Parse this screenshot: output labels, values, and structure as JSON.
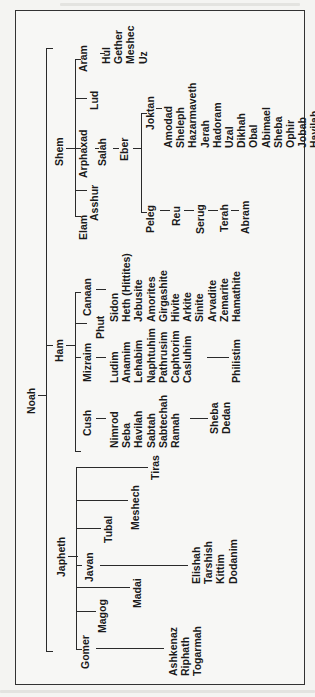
{
  "diagram": {
    "root": "Noah",
    "sons": {
      "shem": {
        "label": "Shem",
        "children": {
          "elam": "Elam",
          "asshur": "Asshur",
          "arphaxad": "Arphaxad",
          "lud": "Lud",
          "aram": "Aram"
        },
        "aram_sons": [
          "Hul",
          "Gether",
          "Meshec",
          "Uz"
        ],
        "salah": "Salah",
        "eber": "Eber",
        "peleg": "Peleg",
        "joktan": "Joktan",
        "joktan_sons": [
          "Amodad",
          "Sheleph",
          "Hazarmaveth",
          "Jerah",
          "Hadoram",
          "Uzal",
          "Dikhah",
          "Obal",
          "Abimael",
          "Sheba",
          "Ophir",
          "Jobab",
          "Havilah"
        ],
        "peleg_line": [
          "Reu",
          "Serug",
          "Terah",
          "Abram"
        ]
      },
      "ham": {
        "label": "Ham",
        "children": {
          "cush": "Cush",
          "mizraim": "Mizraim",
          "phut": "Phut",
          "canaan": "Canaan"
        },
        "cush_sons": [
          "Nimrod",
          "Seba",
          "Havilah",
          "Sabtah",
          "Sabtechah",
          "Ramah"
        ],
        "ramah_sons": [
          "Sheba",
          "Dedan"
        ],
        "mizraim_sons": [
          "Ludim",
          "Anamim",
          "Lehabim",
          "Naphtuhim",
          "Pathrusim",
          "Caphtorim",
          "Casluhim"
        ],
        "casluhim_son": "Philistim",
        "canaan_sons": [
          "Sidon",
          "Heth (Hittites)",
          "Jebusite",
          "Amorites",
          "Girgashite",
          "Hivite",
          "Arkite",
          "Sinite",
          "Arvadite",
          "Zemarite",
          "Hamathite"
        ]
      },
      "japheth": {
        "label": "Japheth",
        "children": {
          "gomer": "Gomer",
          "magog": "Magog",
          "madai": "Madai",
          "javan": "Javan",
          "tubal": "Tubal",
          "meshech": "Meshech",
          "tiras": "Tiras"
        },
        "gomer_sons": [
          "Ashkenaz",
          "Riphath",
          "Togarmah"
        ],
        "javan_sons": [
          "Elishah",
          "Tarshish",
          "Kittim",
          "Dodanim"
        ]
      }
    }
  }
}
